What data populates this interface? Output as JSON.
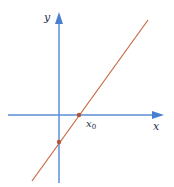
{
  "diagram": {
    "type": "linear-function-graph",
    "axes": {
      "x_label": "x",
      "y_label": "y",
      "color": "#5b8fd6"
    },
    "line": {
      "color": "#c9673f",
      "description": "straight line with positive slope"
    },
    "points": [
      {
        "name": "x-intercept",
        "label": "x",
        "subscript": "0",
        "color": "#b5523a"
      },
      {
        "name": "y-intercept",
        "label": "",
        "color": "#b5523a"
      }
    ]
  }
}
